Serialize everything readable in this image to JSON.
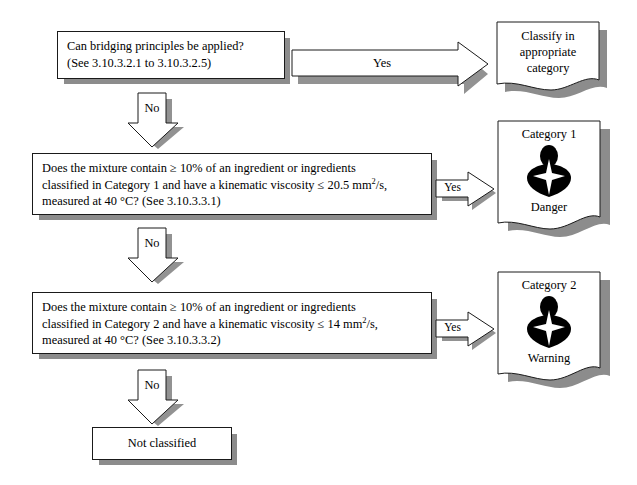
{
  "diagram": {
    "colors": {
      "outline": "#1a1a1a",
      "shadow": "#8c8c8c",
      "fill": "#ffffff",
      "pictogram": "#000000"
    },
    "boxes": [
      {
        "id": "q1",
        "lines": [
          "Can bridging principles be applied?",
          "(See 3.10.3.2.1 to 3.10.3.2.5)"
        ]
      },
      {
        "id": "q2",
        "lines": [
          "Does the mixture contain ≥ 10% of an ingredient or ingredients",
          "classified in Category 1 and have a kinematic viscosity ≤ 20.5 mm",
          "measured at 40 °C? (See 3.10.3.3.1)"
        ],
        "sup": "2",
        "tail": "/s,"
      },
      {
        "id": "q3",
        "lines": [
          "Does the mixture contain ≥ 10% of an ingredient or ingredients",
          "classified in Category 2 and have a kinematic viscosity ≤ 14 mm",
          "measured at 40 °C? (See 3.10.3.3.2)"
        ],
        "sup": "2",
        "tail": "/s,"
      },
      {
        "id": "not_classified",
        "label": "Not classified"
      }
    ],
    "outcomes": [
      {
        "id": "classify",
        "lines": [
          "Classify in",
          "appropriate",
          "category"
        ]
      },
      {
        "id": "cat1",
        "heading": "Category 1",
        "signal_word": "Danger",
        "pictogram": "health-hazard-pictogram"
      },
      {
        "id": "cat2",
        "heading": "Category 2",
        "signal_word": "Warning",
        "pictogram": "health-hazard-pictogram"
      }
    ],
    "arrows": {
      "yes_top": "Yes",
      "yes_cat1": "Yes",
      "yes_cat2": "Yes",
      "no_1": "No",
      "no_2": "No",
      "no_3": "No"
    }
  }
}
